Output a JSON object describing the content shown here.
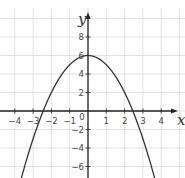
{
  "chart_data": {
    "type": "line",
    "title": "",
    "xlabel": "x",
    "ylabel": "y",
    "function": "y = 6 - x^2",
    "xlim": [
      -4.8,
      5.3
    ],
    "ylim": [
      -7.3,
      10.5
    ],
    "x_ticks": [
      -4,
      -3,
      -2,
      -1,
      0,
      1,
      2,
      3,
      4
    ],
    "x_tick_labels": [
      "−4",
      "−3",
      "−2",
      "−1",
      "0",
      "1",
      "2",
      "3",
      "4"
    ],
    "y_ticks": [
      -6,
      -4,
      -2,
      2,
      4,
      6,
      8
    ],
    "y_tick_labels": [
      "−6",
      "−4",
      "−2",
      "2",
      "4",
      "6",
      "8"
    ],
    "grid": true,
    "series": [
      {
        "name": "parabola",
        "x": [
          -3.64,
          -3,
          -2.45,
          -2,
          -1,
          0,
          1,
          2,
          2.45,
          3,
          3.64
        ],
        "values": [
          -7.25,
          -3,
          0,
          2,
          5,
          6,
          5,
          2,
          0,
          -3,
          -7.25
        ]
      }
    ],
    "annotations": {
      "vertex": [
        0,
        6
      ],
      "x_intercepts": [
        -2.45,
        2.45
      ]
    }
  },
  "layout": {
    "origin_px": [
      88,
      111
    ],
    "x_unit_px": 18.3,
    "y_unit_px": 9.25
  }
}
